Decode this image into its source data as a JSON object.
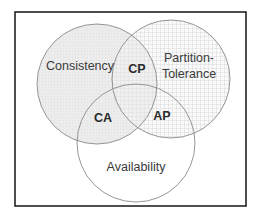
{
  "diagram": {
    "type": "venn",
    "title": "",
    "frame": {
      "x": 15,
      "y": 12,
      "width": 231,
      "height": 194,
      "stroke": "#222222"
    },
    "sets": [
      {
        "id": "consistency",
        "label": "Consistency",
        "cx": 97,
        "cy": 84,
        "r": 60,
        "fill": "#ececec",
        "pattern": "stipple",
        "label_pos": {
          "x": 80,
          "y": 70
        }
      },
      {
        "id": "partition-tolerance",
        "label_line1": "Partition-",
        "label_line2": "Tolerance",
        "cx": 171,
        "cy": 79,
        "r": 59,
        "fill": "#ffffff",
        "pattern": "grid",
        "label_pos": {
          "x": 189,
          "y1": 62,
          "y2": 78
        }
      },
      {
        "id": "availability",
        "label": "Availability",
        "cx": 136,
        "cy": 143,
        "r": 59,
        "fill": "none",
        "pattern": "none",
        "label_pos": {
          "x": 136,
          "y": 171
        }
      }
    ],
    "intersections": [
      {
        "id": "cp",
        "label": "CP",
        "sets": [
          "consistency",
          "partition-tolerance"
        ],
        "x": 137,
        "y": 73
      },
      {
        "id": "ca",
        "label": "CA",
        "sets": [
          "consistency",
          "availability"
        ],
        "x": 103,
        "y": 122
      },
      {
        "id": "ap",
        "label": "AP",
        "sets": [
          "availability",
          "partition-tolerance"
        ],
        "x": 162,
        "y": 120
      }
    ],
    "colors": {
      "circle_stroke": "#8a8a8a",
      "grid_line": "#c4c4c4",
      "stipple": "#e2e2e2",
      "text": "#3a3a3a"
    }
  }
}
